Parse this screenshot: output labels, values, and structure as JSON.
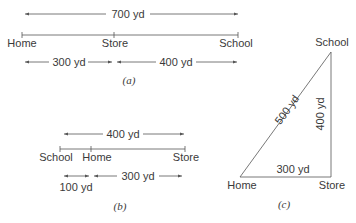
{
  "panel_a": {
    "caption": "(a)",
    "total": "700 yd",
    "labels": {
      "home": "Home",
      "store": "Store",
      "school": "School"
    },
    "seg1": "300 yd",
    "seg2": "400 yd"
  },
  "panel_b": {
    "caption": "(b)",
    "total": "400 yd",
    "labels": {
      "school": "School",
      "home": "Home",
      "store": "Store"
    },
    "seg1": "100 yd",
    "seg2": "300 yd"
  },
  "panel_c": {
    "caption": "(c)",
    "labels": {
      "home": "Home",
      "store": "Store",
      "school": "School"
    },
    "base": "300 yd",
    "height": "400 yd",
    "hyp": "500 yd"
  },
  "colors": {
    "line": "#555555",
    "text": "#3a3a3a"
  }
}
